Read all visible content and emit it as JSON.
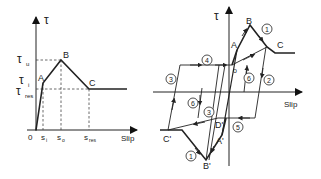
{
  "left_diagram": {
    "title": "Bond stress-slip monotonic envelope",
    "y_axis_label": "τ",
    "x_axis_label": "Slip",
    "origin_label": "0",
    "y_ticks": [
      {
        "main": "τ",
        "sub": "u"
      },
      {
        "main": "τ",
        "sub": "i"
      },
      {
        "main": "τ",
        "sub": "res"
      }
    ],
    "x_ticks": [
      {
        "main": "s",
        "sub": "i"
      },
      {
        "main": "s",
        "sub": "o"
      },
      {
        "main": "s",
        "sub": "res"
      }
    ],
    "points": {
      "A": "A",
      "B": "B",
      "C": "C"
    }
  },
  "right_diagram": {
    "title": "Bond stress-slip cyclic hysteresis",
    "y_axis_label": "τ",
    "x_axis_label": "Slip",
    "points": {
      "A": "A",
      "B": "B",
      "C": "C",
      "o": "o",
      "A_prime": "A'",
      "B_prime": "B'",
      "C_prime": "C'",
      "D_prime": "D'"
    },
    "path_markers": [
      "1",
      "2",
      "3",
      "4",
      "5",
      "6",
      "1",
      "3",
      "6",
      "5"
    ]
  },
  "colors": {
    "line": "#222222",
    "dashed": "#444444",
    "background": "#ffffff"
  }
}
